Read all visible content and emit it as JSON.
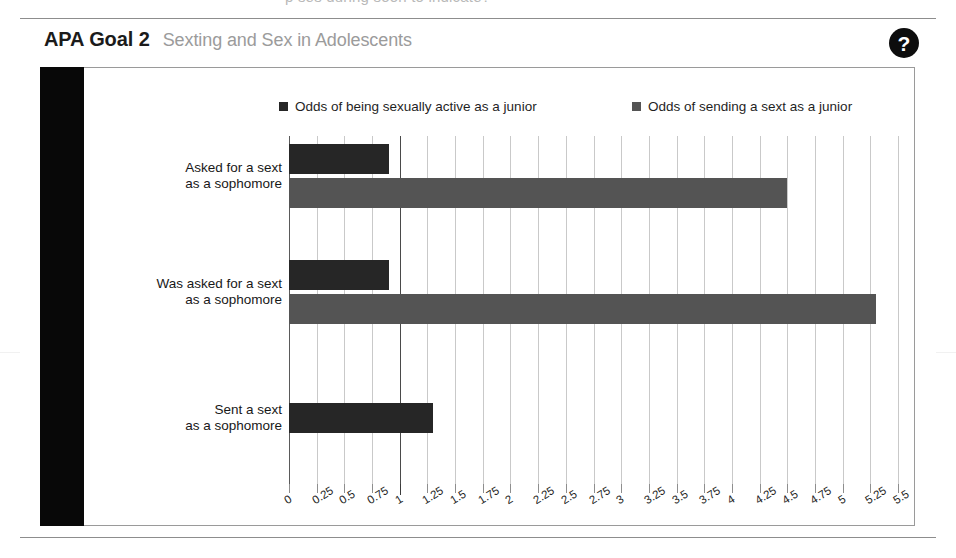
{
  "page": {
    "cut_off_text_above": "p                 ses during soon to indicate?"
  },
  "card": {
    "title_main": "APA Goal 2",
    "title_sub": "Sexting and Sex in Adolescents",
    "help_icon": "question-mark-icon",
    "help_label": "?"
  },
  "chart_data": {
    "type": "bar",
    "orientation": "horizontal",
    "title": "Sexting and Sex in Adolescents",
    "xlabel": "",
    "ylabel": "",
    "categories": [
      "Asked for a sext\nas a sophomore",
      "Was asked for a sext\nas a sophomore",
      "Sent a sext\nas a sophomore"
    ],
    "categories_lines": [
      [
        "Asked for a sext",
        "as a sophomore"
      ],
      [
        "Was asked for a sext",
        "as a sophomore"
      ],
      [
        "Sent a sext",
        "as a sophomore"
      ]
    ],
    "series": [
      {
        "name": "Odds of being sexually active as a junior",
        "color": "#262626",
        "values": [
          0.9,
          0.9,
          1.3
        ]
      },
      {
        "name": "Odds of sending a sext as a junior",
        "color": "#545454",
        "values": [
          4.5,
          5.3,
          null
        ]
      }
    ],
    "xlim": [
      0,
      5.5
    ],
    "xticks": [
      0,
      0.25,
      0.5,
      0.75,
      1,
      1.25,
      1.5,
      1.75,
      2,
      2.25,
      2.5,
      2.75,
      3,
      3.25,
      3.5,
      3.75,
      4,
      4.25,
      4.5,
      4.75,
      5,
      5.25,
      5.5
    ],
    "xtick_labels": [
      "0",
      "0.25",
      "0.5",
      "0.75",
      "1",
      "1.25",
      "1.5",
      "1.75",
      "2",
      "2.25",
      "2.5",
      "2.75",
      "3",
      "3.25",
      "3.5",
      "3.75",
      "4",
      "4.25",
      "4.5",
      "4.75",
      "5",
      "5.25",
      "5.5"
    ],
    "grid": true,
    "grid_axis": "x",
    "legend_position": "top",
    "reference_line": 1
  }
}
